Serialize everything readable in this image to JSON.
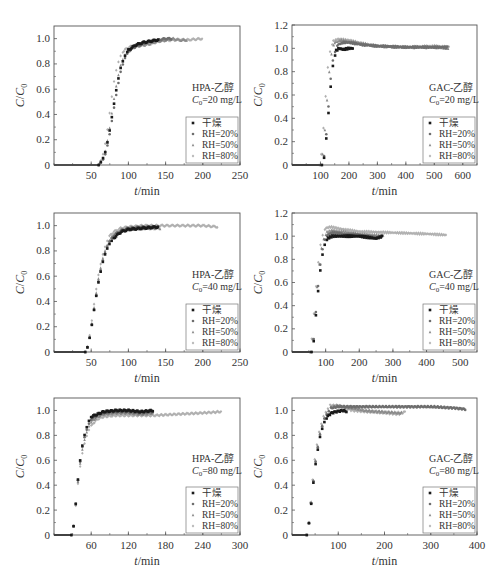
{
  "figure": {
    "panel_ids": [
      "hpa_20",
      "gac_20",
      "hpa_40",
      "gac_40",
      "hpa_80",
      "gac_80"
    ]
  },
  "legend": {
    "entries": [
      "干燥",
      "RH=20%",
      "RH=50%",
      "RH=80%"
    ],
    "colors": [
      "#1a1a1a",
      "#6e6e6e",
      "#8a8a8a",
      "#b0b0b0"
    ]
  },
  "chart_data": [
    {
      "id": "hpa_20",
      "type": "scatter",
      "annotation_line1": "HPA-乙醇",
      "annotation_line2": "C0=20 mg/L",
      "xlabel": "t/min",
      "ylabel": "C/C0",
      "xlim": [
        0,
        250
      ],
      "ylim": [
        0,
        1.1
      ],
      "xticks": [
        50,
        100,
        150,
        200,
        250
      ],
      "yticks": [
        0,
        0.2,
        0.4,
        0.6,
        0.8,
        1.0
      ],
      "x_tick_labels": [
        "50",
        "100",
        "150",
        "200",
        "250"
      ],
      "y_tick_labels": [
        "0",
        "0.2",
        "0.4",
        "0.6",
        "0.8",
        "1.0"
      ],
      "grid": false,
      "legend_position": "lower right",
      "series": [
        {
          "name": "干燥",
          "x": [
            0,
            60,
            65,
            70,
            75,
            80,
            85,
            90,
            95,
            100,
            110,
            120,
            130,
            140
          ],
          "y": [
            0,
            0,
            0.04,
            0.12,
            0.28,
            0.46,
            0.64,
            0.78,
            0.86,
            0.91,
            0.95,
            0.97,
            0.98,
            0.99
          ]
        },
        {
          "name": "RH=20%",
          "x": [
            0,
            60,
            65,
            70,
            75,
            80,
            85,
            90,
            95,
            100,
            110,
            120,
            130,
            140,
            150,
            160
          ],
          "y": [
            0,
            0,
            0.03,
            0.1,
            0.25,
            0.43,
            0.6,
            0.75,
            0.84,
            0.9,
            0.94,
            0.96,
            0.98,
            0.99,
            1.0,
            1.0
          ]
        },
        {
          "name": "RH=50%",
          "x": [
            0,
            60,
            65,
            70,
            75,
            80,
            85,
            90,
            95,
            100,
            110,
            120,
            130,
            140,
            150,
            160,
            170,
            180
          ],
          "y": [
            0,
            0,
            0.04,
            0.13,
            0.3,
            0.5,
            0.67,
            0.8,
            0.87,
            0.91,
            0.94,
            0.95,
            0.96,
            0.98,
            0.99,
            1.0,
            0.99,
            0.99
          ]
        },
        {
          "name": "RH=80%",
          "x": [
            0,
            60,
            65,
            70,
            75,
            80,
            85,
            90,
            95,
            100,
            110,
            120,
            140,
            160,
            180,
            200
          ],
          "y": [
            0,
            0,
            0.06,
            0.2,
            0.42,
            0.64,
            0.79,
            0.87,
            0.91,
            0.93,
            0.95,
            0.96,
            0.98,
            0.99,
            0.99,
            1.0
          ]
        }
      ]
    },
    {
      "id": "gac_20",
      "type": "scatter",
      "annotation_line1": "GAC-乙醇",
      "annotation_line2": "C0=20 mg/L",
      "xlabel": "t/min",
      "ylabel": "C/C0",
      "xlim": [
        0,
        650
      ],
      "ylim": [
        0,
        1.2
      ],
      "xticks": [
        100,
        200,
        300,
        400,
        500,
        600
      ],
      "yticks": [
        0,
        0.2,
        0.4,
        0.6,
        0.8,
        1.0,
        1.2
      ],
      "x_tick_labels": [
        "100",
        "200",
        "300",
        "400",
        "500",
        "600"
      ],
      "y_tick_labels": [
        "0",
        "0.2",
        "0.4",
        "0.6",
        "0.8",
        "1.0",
        "1.2"
      ],
      "grid": false,
      "legend_position": "lower right",
      "series": [
        {
          "name": "干燥",
          "x": [
            0,
            105,
            115,
            125,
            135,
            145,
            155,
            165,
            180,
            200,
            220
          ],
          "y": [
            0,
            0,
            0.08,
            0.35,
            0.65,
            0.88,
            0.98,
            1.0,
            0.99,
            1.0,
            1.0
          ]
        },
        {
          "name": "RH=20%",
          "x": [
            0,
            105,
            115,
            125,
            135,
            145,
            160,
            180,
            200,
            250,
            300,
            400,
            500,
            550
          ],
          "y": [
            0,
            0,
            0.1,
            0.4,
            0.72,
            0.93,
            1.03,
            1.05,
            1.05,
            1.03,
            1.02,
            1.01,
            1.01,
            1.01
          ]
        },
        {
          "name": "RH=50%",
          "x": [
            0,
            100,
            110,
            120,
            130,
            140,
            150,
            170,
            200,
            250,
            300,
            400,
            500,
            555
          ],
          "y": [
            0,
            0,
            0.12,
            0.45,
            0.78,
            0.97,
            1.05,
            1.07,
            1.06,
            1.04,
            1.02,
            1.01,
            1.01,
            1.0
          ]
        },
        {
          "name": "RH=80%",
          "x": [
            0,
            95,
            105,
            115,
            125,
            135,
            145,
            160,
            200,
            250,
            300,
            400,
            500,
            555
          ],
          "y": [
            0,
            0,
            0.12,
            0.48,
            0.82,
            1.0,
            1.06,
            1.08,
            1.07,
            1.04,
            1.02,
            1.01,
            1.02,
            1.01
          ]
        }
      ]
    },
    {
      "id": "hpa_40",
      "type": "scatter",
      "annotation_line1": "HPA-乙醇",
      "annotation_line2": "C0=40 mg/L",
      "xlabel": "t/min",
      "ylabel": "C/C0",
      "xlim": [
        0,
        250
      ],
      "ylim": [
        0,
        1.1
      ],
      "xticks": [
        50,
        100,
        150,
        200,
        250
      ],
      "yticks": [
        0,
        0.2,
        0.4,
        0.6,
        0.8,
        1.0
      ],
      "x_tick_labels": [
        "50",
        "100",
        "150",
        "200",
        "250"
      ],
      "y_tick_labels": [
        "0",
        "0.2",
        "0.4",
        "0.6",
        "0.8",
        "1.0"
      ],
      "grid": false,
      "legend_position": "lower right",
      "series": [
        {
          "name": "干燥",
          "x": [
            0,
            42,
            46,
            50,
            55,
            60,
            65,
            70,
            75,
            80,
            90,
            100,
            120,
            140
          ],
          "y": [
            0,
            0,
            0.05,
            0.18,
            0.38,
            0.56,
            0.7,
            0.8,
            0.86,
            0.9,
            0.95,
            0.97,
            0.98,
            0.99
          ]
        },
        {
          "name": "RH=20%",
          "x": [
            0,
            42,
            46,
            50,
            55,
            60,
            65,
            70,
            75,
            80,
            90,
            100,
            120,
            140
          ],
          "y": [
            0,
            0,
            0.05,
            0.18,
            0.38,
            0.57,
            0.71,
            0.81,
            0.88,
            0.92,
            0.96,
            0.98,
            0.99,
            0.99
          ]
        },
        {
          "name": "RH=50%",
          "x": [
            0,
            42,
            46,
            50,
            55,
            60,
            65,
            70,
            75,
            80,
            90,
            100,
            120,
            145
          ],
          "y": [
            0,
            0,
            0.05,
            0.19,
            0.4,
            0.59,
            0.73,
            0.83,
            0.89,
            0.93,
            0.96,
            0.97,
            0.98,
            0.98
          ]
        },
        {
          "name": "RH=80%",
          "x": [
            0,
            42,
            46,
            50,
            55,
            60,
            65,
            70,
            75,
            80,
            90,
            100,
            120,
            150,
            180,
            200,
            220
          ],
          "y": [
            0,
            0,
            0.06,
            0.21,
            0.43,
            0.62,
            0.76,
            0.86,
            0.92,
            0.95,
            0.98,
            0.99,
            1.0,
            1.0,
            1.0,
            1.0,
            0.99
          ]
        }
      ]
    },
    {
      "id": "gac_40",
      "type": "scatter",
      "annotation_line1": "GAC-乙醇",
      "annotation_line2": "C0=40 mg/L",
      "xlabel": "t/min",
      "ylabel": "C/C0",
      "xlim": [
        0,
        550
      ],
      "ylim": [
        0,
        1.2
      ],
      "xticks": [
        100,
        200,
        300,
        400,
        500
      ],
      "yticks": [
        0,
        0.2,
        0.4,
        0.6,
        0.8,
        1.0,
        1.2
      ],
      "x_tick_labels": [
        "100",
        "200",
        "300",
        "400",
        "500"
      ],
      "y_tick_labels": [
        "0",
        "0.2",
        "0.4",
        "0.6",
        "0.8",
        "1.0",
        "1.2"
      ],
      "grid": false,
      "legend_position": "lower right",
      "series": [
        {
          "name": "干燥",
          "x": [
            0,
            58,
            65,
            72,
            80,
            88,
            96,
            105,
            120,
            150,
            200,
            250,
            270
          ],
          "y": [
            0,
            0,
            0.1,
            0.35,
            0.6,
            0.8,
            0.92,
            0.98,
            1.0,
            1.0,
            1.0,
            0.98,
            1.0
          ]
        },
        {
          "name": "RH=20%",
          "x": [
            0,
            58,
            65,
            72,
            80,
            88,
            96,
            105,
            120,
            150,
            200,
            250,
            270
          ],
          "y": [
            0,
            0,
            0.12,
            0.38,
            0.65,
            0.85,
            0.96,
            1.01,
            1.03,
            1.02,
            1.01,
            0.99,
            1.0
          ]
        },
        {
          "name": "RH=50%",
          "x": [
            0,
            55,
            62,
            70,
            78,
            86,
            95,
            105,
            120,
            150,
            200,
            250,
            275
          ],
          "y": [
            0,
            0,
            0.12,
            0.4,
            0.68,
            0.88,
            0.99,
            1.04,
            1.05,
            1.04,
            1.02,
            1.01,
            1.0
          ]
        },
        {
          "name": "RH=80%",
          "x": [
            0,
            52,
            60,
            68,
            76,
            84,
            92,
            100,
            115,
            150,
            200,
            300,
            400,
            460
          ],
          "y": [
            0,
            0,
            0.14,
            0.44,
            0.72,
            0.92,
            1.02,
            1.07,
            1.08,
            1.06,
            1.04,
            1.03,
            1.02,
            1.01
          ]
        }
      ]
    },
    {
      "id": "hpa_80",
      "type": "scatter",
      "annotation_line1": "HPA-乙醇",
      "annotation_line2": "C0=80 mg/L",
      "xlabel": "t/min",
      "ylabel": "C/C0",
      "xlim": [
        0,
        300
      ],
      "ylim": [
        0,
        1.1
      ],
      "xticks": [
        60,
        120,
        180,
        240,
        300
      ],
      "yticks": [
        0,
        0.2,
        0.4,
        0.6,
        0.8,
        1.0
      ],
      "x_tick_labels": [
        "60",
        "120",
        "180",
        "240",
        "300"
      ],
      "y_tick_labels": [
        "0",
        "0.2",
        "0.4",
        "0.6",
        "0.8",
        "1.0"
      ],
      "grid": false,
      "legend_position": "lower right",
      "series": [
        {
          "name": "干燥",
          "x": [
            0,
            28,
            32,
            36,
            40,
            45,
            50,
            55,
            60,
            70,
            80,
            100,
            120,
            140,
            160
          ],
          "y": [
            0,
            0,
            0.08,
            0.3,
            0.52,
            0.7,
            0.82,
            0.9,
            0.95,
            0.97,
            0.99,
            1.0,
            1.0,
            0.99,
            1.0
          ]
        },
        {
          "name": "RH=20%",
          "x": [
            0,
            28,
            32,
            36,
            40,
            45,
            50,
            55,
            60,
            70,
            80,
            100,
            120,
            140,
            160
          ],
          "y": [
            0,
            0,
            0.08,
            0.3,
            0.51,
            0.69,
            0.8,
            0.88,
            0.93,
            0.96,
            0.98,
            0.99,
            0.99,
            0.98,
            0.99
          ]
        },
        {
          "name": "RH=50%",
          "x": [
            0,
            28,
            32,
            36,
            40,
            45,
            50,
            55,
            60,
            70,
            80,
            100,
            120,
            140,
            160
          ],
          "y": [
            0,
            0,
            0.08,
            0.29,
            0.5,
            0.67,
            0.78,
            0.86,
            0.91,
            0.95,
            0.97,
            0.98,
            0.98,
            0.97,
            0.98
          ]
        },
        {
          "name": "RH=80%",
          "x": [
            0,
            28,
            32,
            36,
            40,
            45,
            50,
            55,
            60,
            70,
            80,
            100,
            120,
            160,
            200,
            240,
            270
          ],
          "y": [
            0,
            0,
            0.08,
            0.28,
            0.48,
            0.64,
            0.75,
            0.83,
            0.88,
            0.93,
            0.95,
            0.96,
            0.96,
            0.96,
            0.97,
            0.98,
            0.99
          ]
        }
      ]
    },
    {
      "id": "gac_80",
      "type": "scatter",
      "annotation_line1": "GAC-乙醇",
      "annotation_line2": "C0=80 mg/L",
      "xlabel": "t/min",
      "ylabel": "C/C0",
      "xlim": [
        0,
        400
      ],
      "ylim": [
        0,
        1.1
      ],
      "xticks": [
        100,
        200,
        300,
        400
      ],
      "yticks": [
        0,
        0.2,
        0.4,
        0.6,
        0.8,
        1.0
      ],
      "x_tick_labels": [
        "100",
        "200",
        "300",
        "400"
      ],
      "y_tick_labels": [
        "0",
        "0.2",
        "0.4",
        "0.6",
        "0.8",
        "1.0"
      ],
      "grid": false,
      "legend_position": "lower right",
      "series": [
        {
          "name": "干燥",
          "x": [
            0,
            32,
            38,
            45,
            52,
            60,
            68,
            76,
            85,
            95,
            110,
            120
          ],
          "y": [
            0,
            0,
            0.12,
            0.38,
            0.6,
            0.78,
            0.89,
            0.95,
            0.98,
            0.99,
            1.0,
            0.99
          ]
        },
        {
          "name": "RH=20%",
          "x": [
            0,
            32,
            38,
            45,
            52,
            60,
            68,
            76,
            85,
            100,
            150,
            200,
            250,
            300,
            350,
            375
          ],
          "y": [
            0,
            0,
            0.12,
            0.39,
            0.62,
            0.8,
            0.91,
            0.98,
            1.02,
            1.03,
            1.03,
            1.03,
            1.03,
            1.03,
            1.02,
            1.01
          ]
        },
        {
          "name": "RH=50%",
          "x": [
            0,
            32,
            38,
            45,
            52,
            60,
            68,
            76,
            85,
            100,
            130,
            160,
            200,
            240
          ],
          "y": [
            0,
            0,
            0.13,
            0.4,
            0.63,
            0.81,
            0.92,
            0.99,
            1.03,
            1.04,
            1.02,
            1.0,
            0.99,
            0.98
          ]
        },
        {
          "name": "RH=80%",
          "x": [
            0,
            30,
            36,
            43,
            50,
            58,
            66,
            74,
            82,
            100,
            130,
            160,
            200,
            230,
            245
          ],
          "y": [
            0,
            0,
            0.12,
            0.4,
            0.64,
            0.82,
            0.93,
            1.0,
            1.04,
            1.04,
            1.0,
            0.99,
            0.98,
            0.97,
            0.99
          ]
        }
      ]
    }
  ]
}
